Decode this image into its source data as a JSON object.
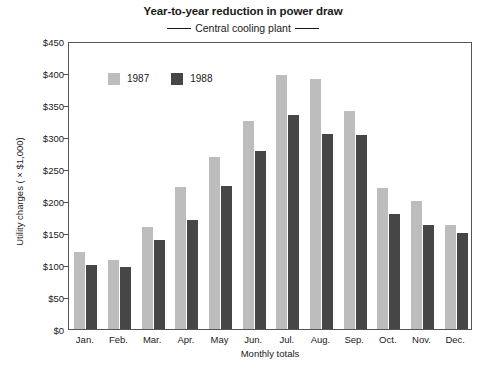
{
  "chart_data": {
    "type": "bar",
    "title": "Year-to-year reduction in power draw",
    "subtitle": "Central cooling plant",
    "xlabel": "Monthly totals",
    "ylabel": "Utility charges ( × $1,000)",
    "categories": [
      "Jan.",
      "Feb.",
      "Mar.",
      "Apr.",
      "May",
      "Jun.",
      "Jul.",
      "Aug.",
      "Sep.",
      "Oct.",
      "Nov.",
      "Dec."
    ],
    "series": [
      {
        "name": "1987",
        "color": "#bdbdbd",
        "values": [
          120,
          108,
          160,
          222,
          268,
          325,
          397,
          390,
          340,
          220,
          200,
          163
        ]
      },
      {
        "name": "1988",
        "color": "#464646",
        "values": [
          100,
          97,
          139,
          171,
          224,
          278,
          335,
          305,
          303,
          180,
          163,
          150
        ]
      }
    ],
    "ylim": [
      0,
      450
    ],
    "yticks": [
      0,
      50,
      100,
      150,
      200,
      250,
      300,
      350,
      400,
      450
    ],
    "ytick_labels": [
      "$0",
      "$50",
      "$100",
      "$150",
      "$200",
      "$250",
      "$300",
      "$350",
      "$400",
      "$450"
    ],
    "grid": false,
    "legend_position": "inside-upper-left",
    "frame": true
  }
}
